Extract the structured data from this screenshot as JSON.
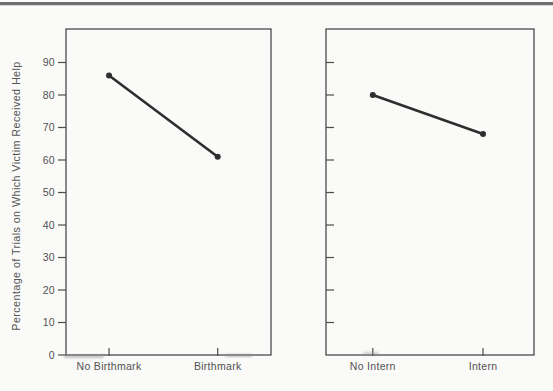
{
  "chart_data": [
    {
      "type": "line",
      "panel": "left",
      "categories": [
        "No Birthmark",
        "Birthmark"
      ],
      "values": [
        86,
        61
      ],
      "xlabel": "",
      "ylabel": "Percentage of Trials on Which Victim Received Help",
      "ylim": [
        0,
        100
      ],
      "yticks": [
        0,
        10,
        20,
        30,
        40,
        50,
        60,
        70,
        80,
        90
      ],
      "ytick_labels": [
        "0",
        "10",
        "20",
        "30",
        "40",
        "50",
        "60",
        "70",
        "80",
        "90"
      ],
      "ytick_labels_visible": true,
      "ytick_side": "outside",
      "grid": false,
      "legend": "none",
      "marker": "filled-circle"
    },
    {
      "type": "line",
      "panel": "right",
      "categories": [
        "No Intern",
        "Intern"
      ],
      "values": [
        80,
        68
      ],
      "xlabel": "",
      "ylabel": "",
      "ylim": [
        0,
        100
      ],
      "yticks": [
        10,
        20,
        30,
        40,
        50,
        60,
        70,
        80,
        90
      ],
      "ytick_labels": [],
      "ytick_labels_visible": false,
      "ytick_side": "inside",
      "grid": false,
      "legend": "none",
      "marker": "filled-circle"
    }
  ],
  "colors": {
    "background": "#fafaf8",
    "axis": "#4c4c4c",
    "text": "#515151",
    "line": "#2e2e2e",
    "page_rule": "#6f6f6f"
  }
}
